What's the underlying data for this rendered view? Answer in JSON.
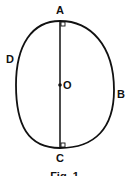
{
  "diagram": {
    "labels": {
      "top": "A",
      "right": "B",
      "bottom": "C",
      "left": "D",
      "center": "O"
    },
    "caption": "Fig. 1",
    "colors": {
      "stroke": "#111111",
      "background": "#ffffff"
    }
  }
}
